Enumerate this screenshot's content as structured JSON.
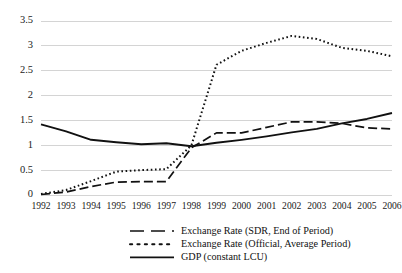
{
  "chart_data": {
    "type": "line",
    "title": "",
    "subtitle": "",
    "xlabel": "",
    "ylabel": "",
    "grid": "horizontal",
    "legend_position": "bottom",
    "categories": [
      "1992",
      "1993",
      "1994",
      "1995",
      "1996",
      "1997",
      "1998",
      "1999",
      "2000",
      "2001",
      "2002",
      "2003",
      "2004",
      "2005",
      "2006"
    ],
    "x": [
      1992,
      1993,
      1994,
      1995,
      1996,
      1997,
      1998,
      1999,
      2000,
      2001,
      2002,
      2003,
      2004,
      2005,
      2006
    ],
    "ylim": [
      0,
      3.5
    ],
    "yticks": [
      0,
      0.5,
      1,
      1.5,
      2,
      2.5,
      3,
      3.5
    ],
    "ytick_labels": [
      "0",
      "0.5",
      "1",
      "1.5",
      "2",
      "2.5",
      "3",
      "3.5"
    ],
    "series": [
      {
        "name": "Exchange Rate (SDR, End of Period)",
        "style": "dashed",
        "color": "#111111",
        "values": [
          0.01,
          0.06,
          0.17,
          0.26,
          0.27,
          0.27,
          0.95,
          1.25,
          1.25,
          1.36,
          1.47,
          1.47,
          1.44,
          1.35,
          1.33
        ]
      },
      {
        "name": "Exchange Rate (Official, Average Period)",
        "style": "dotted",
        "color": "#111111",
        "values": [
          0.02,
          0.1,
          0.28,
          0.47,
          0.5,
          0.52,
          1.0,
          2.62,
          2.9,
          3.06,
          3.2,
          3.14,
          2.96,
          2.9,
          2.79
        ]
      },
      {
        "name": "GDP (constant LCU)",
        "style": "solid",
        "color": "#111111",
        "values": [
          1.42,
          1.28,
          1.11,
          1.06,
          1.02,
          1.04,
          0.98,
          1.05,
          1.11,
          1.18,
          1.26,
          1.33,
          1.44,
          1.53,
          1.65
        ]
      }
    ]
  },
  "yaxis": {
    "ticks": [
      {
        "label": "3.5"
      },
      {
        "label": "3"
      },
      {
        "label": "2.5"
      },
      {
        "label": "2"
      },
      {
        "label": "1.5"
      },
      {
        "label": "1"
      },
      {
        "label": "0.5"
      },
      {
        "label": "0"
      }
    ]
  },
  "xaxis": {
    "ticks": [
      {
        "label": "1992"
      },
      {
        "label": "1993"
      },
      {
        "label": "1994"
      },
      {
        "label": "1995"
      },
      {
        "label": "1996"
      },
      {
        "label": "1997"
      },
      {
        "label": "1998"
      },
      {
        "label": "1999"
      },
      {
        "label": "2000"
      },
      {
        "label": "2001"
      },
      {
        "label": "2002"
      },
      {
        "label": "2003"
      },
      {
        "label": "2004"
      },
      {
        "label": "2005"
      },
      {
        "label": "2006"
      }
    ]
  },
  "legend": {
    "entries": [
      {
        "label": "Exchange Rate (SDR, End of Period)",
        "style": "dashed"
      },
      {
        "label": "Exchange Rate (Official, Average Period)",
        "style": "dotted"
      },
      {
        "label": "GDP (constant LCU)",
        "style": "solid"
      }
    ]
  }
}
